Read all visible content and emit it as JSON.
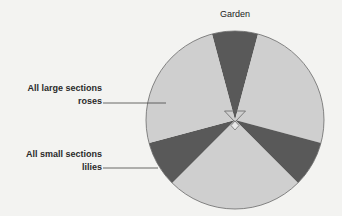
{
  "title": "Garden",
  "labels": {
    "roses": {
      "line1": "All large sections",
      "line2": "roses"
    },
    "lilies": {
      "line1": "All small sections",
      "line2": "lilies"
    }
  },
  "diagram": {
    "shape": "circle",
    "center": [
      235,
      120
    ],
    "radius": 89,
    "sections": [
      {
        "name": "lilies",
        "size": "small",
        "start_deg": -15,
        "end_deg": 15
      },
      {
        "name": "roses",
        "size": "large",
        "start_deg": 15,
        "end_deg": 105
      },
      {
        "name": "lilies",
        "size": "small",
        "start_deg": 105,
        "end_deg": 135
      },
      {
        "name": "roses",
        "size": "large",
        "start_deg": 135,
        "end_deg": 225
      },
      {
        "name": "lilies",
        "size": "small",
        "start_deg": 225,
        "end_deg": 255
      },
      {
        "name": "roses",
        "size": "large",
        "start_deg": 255,
        "end_deg": 345
      }
    ],
    "colors": {
      "roses": "#cfcfcf",
      "lilies": "#595959",
      "outline": "#6a6a6a"
    }
  }
}
